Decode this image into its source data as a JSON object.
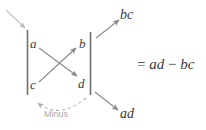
{
  "diagram": {
    "matrix": {
      "entries": {
        "top_left": "a",
        "top_right": "b",
        "bottom_left": "c",
        "bottom_right": "d"
      },
      "bar_color": "#6e6e6e"
    },
    "arrows": {
      "incoming_label": "",
      "diagonal_down": {
        "from": "a",
        "to": "d",
        "product_label": "ad"
      },
      "diagonal_up": {
        "from": "c",
        "to": "b",
        "product_label": "bc"
      },
      "arrow_color": "#8a8a8a"
    },
    "products": {
      "upper_right": "bc",
      "lower_right": "ad"
    },
    "minus_arc": {
      "caption": "Minus",
      "caption_color": "#a9a9a9",
      "stroke_color": "#b0b0b0"
    },
    "result": {
      "equals": "=",
      "first_term": "ad",
      "operator": "−",
      "second_term": "bc",
      "full_text": "= ad − bc"
    }
  }
}
